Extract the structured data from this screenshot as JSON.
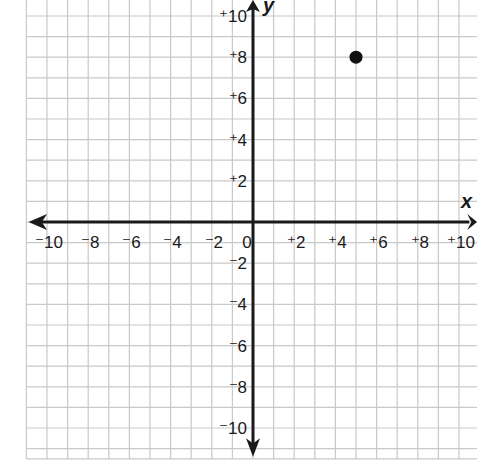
{
  "chart_data": {
    "type": "scatter",
    "title": "",
    "xlabel": "x",
    "ylabel": "y",
    "xlim": [
      -11,
      10.8
    ],
    "ylim": [
      -11.5,
      10.8
    ],
    "grid": true,
    "grid_step": 1,
    "x_ticks": [
      -10,
      -8,
      -6,
      -4,
      -2,
      0,
      2,
      4,
      6,
      8,
      10
    ],
    "x_tick_labels": [
      "⁻10",
      "⁻8",
      "⁻6",
      "⁻4",
      "⁻2",
      "0",
      "⁺2",
      "⁺4",
      "⁺6",
      "⁺8",
      "⁺10"
    ],
    "y_ticks": [
      10,
      8,
      6,
      4,
      2,
      -2,
      -4,
      -6,
      -8,
      -10
    ],
    "y_tick_labels": [
      "⁺10",
      "⁺8",
      "⁺6",
      "⁺4",
      "⁺2",
      "⁻2",
      "⁻4",
      "⁻6",
      "⁻8",
      "⁻10"
    ],
    "series": [
      {
        "name": "point",
        "points": [
          {
            "x": 5,
            "y": 8
          }
        ],
        "color": "#111111"
      }
    ],
    "legend": null,
    "colors": {
      "grid": "#c9c9c9",
      "axis": "#1a1a1a",
      "point": "#111111",
      "background": "#ffffff"
    }
  },
  "labels": {
    "x_axis": "x",
    "y_axis": "y"
  }
}
